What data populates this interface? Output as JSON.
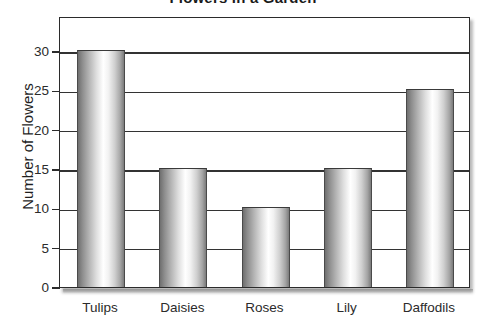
{
  "chart_data": {
    "type": "bar",
    "title": "Flowers in a Garden",
    "xlabel": "",
    "ylabel": "Number of Flowers",
    "categories": [
      "Tulips",
      "Daisies",
      "Roses",
      "Lily",
      "Daffodils"
    ],
    "values": [
      30,
      15,
      10,
      15,
      25
    ],
    "ylim": [
      0,
      30
    ],
    "ytick_labels": [
      "0",
      "5",
      "10",
      "15",
      "20",
      "25",
      "30"
    ],
    "ytick_values": [
      0,
      5,
      10,
      15,
      20,
      25,
      30
    ],
    "grid": true,
    "legend": null,
    "series": [
      {
        "name": "Number of Flowers",
        "values": [
          30,
          15,
          10,
          15,
          25
        ]
      }
    ],
    "style": {
      "bar_fill": "gradient-gray-cylinder",
      "bar_edge_color": "#4a4a4a",
      "gridline_color": "#333333",
      "frame_color": "#2b2b2b",
      "background": "#ffffff",
      "text_color": "#2b2b2b"
    }
  }
}
